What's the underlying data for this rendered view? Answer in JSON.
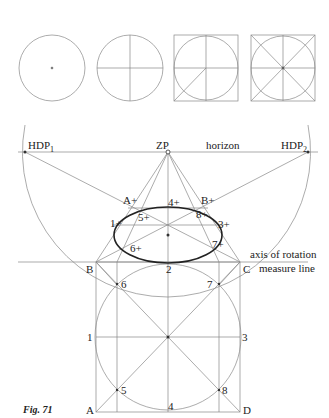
{
  "figure": {
    "caption": "Fig. 71",
    "labels": {
      "hdp1": "HDP",
      "hdp1_sub": "1",
      "hdp2": "HDP",
      "hdp2_sub": "2",
      "zp": "ZP",
      "horizon": "horizon",
      "axis": "axis of rotation",
      "measure": "measure line",
      "A_plus": "A+",
      "B_plus": "B+",
      "p1_plus": "1+",
      "p3_plus": "3+",
      "p4_plus": "4+",
      "p5_plus": "5+",
      "p6_plus": "6+",
      "p7_plus": "7+",
      "p8_plus": "8+",
      "B": "B",
      "C": "C",
      "A": "A",
      "D": "D",
      "p1": "1",
      "p2": "2",
      "p3": "3",
      "p4": "4",
      "p5": "5",
      "p6": "6",
      "p7": "7",
      "p8": "8"
    },
    "steps": [
      "circle with center point",
      "circle with cross axes",
      "circle in square with diagonal",
      "circle in square with both diagonals and 8 points"
    ]
  },
  "colors": {
    "line": "#777777",
    "ellipse": "#222222",
    "text": "#222222"
  }
}
